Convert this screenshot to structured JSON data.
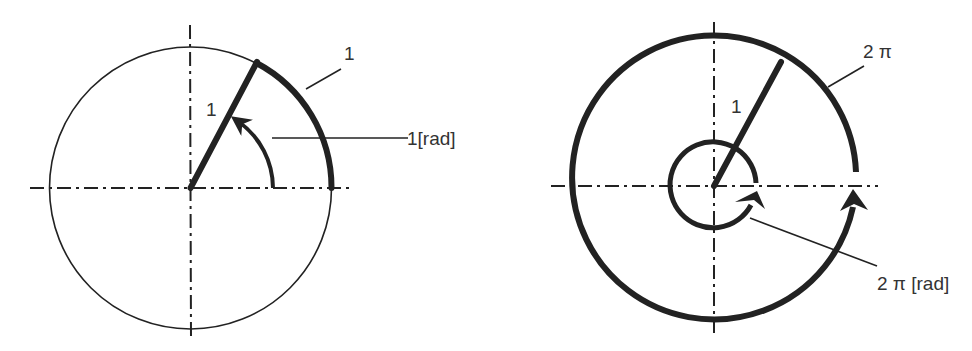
{
  "colors": {
    "stroke": "#222222",
    "text": "#333333",
    "background": "#ffffff"
  },
  "left_diagram": {
    "title": "1 radian",
    "radius_label": "1",
    "arc_label": "1",
    "angle_label": "1[rad]"
  },
  "right_diagram": {
    "title": "2 pi radians",
    "radius_label": "1",
    "arc_label": "2 π",
    "angle_label": "2 π [rad]"
  }
}
